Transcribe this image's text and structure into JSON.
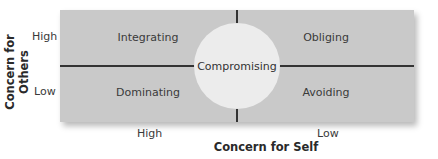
{
  "diagram": {
    "title_y": "Concern for Others",
    "title_x": "Concern for Self",
    "y_ticks": {
      "high": "High",
      "low": "Low"
    },
    "x_ticks": {
      "high": "High",
      "low": "Low"
    },
    "quadrants": {
      "top_left": "Integrating",
      "top_right": "Obliging",
      "bottom_left": "Dominating",
      "bottom_right": "Avoiding"
    },
    "center": "Compromising",
    "colors": {
      "box": "#c9c9c9",
      "circle": "#ececec",
      "lines": "#333333"
    }
  }
}
